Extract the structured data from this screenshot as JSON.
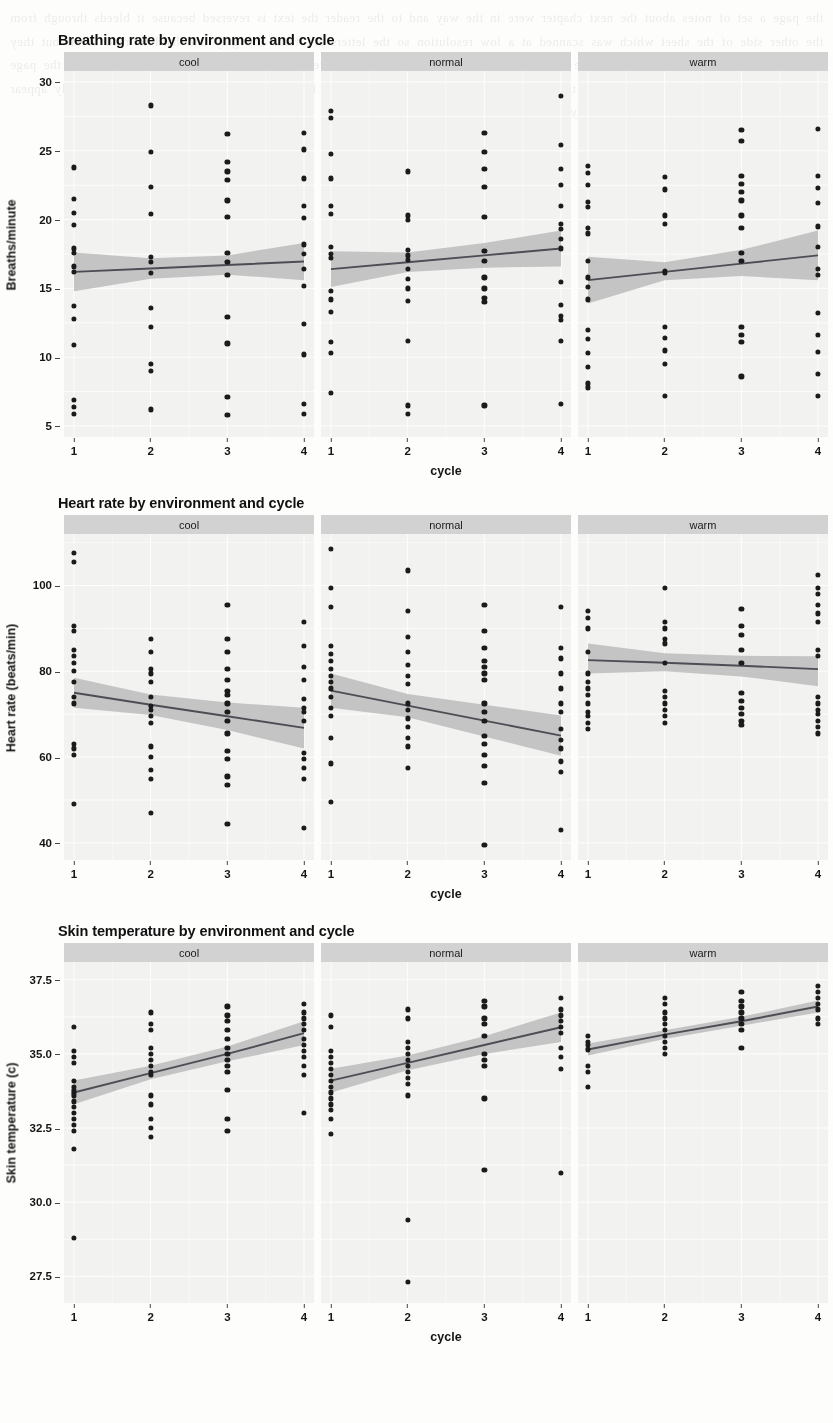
{
  "page": {
    "background_color": "#fdfdfc",
    "bleed_through_text": "the page a set of notes about the next chapter were in the way and to the reader the text is reversed because it bleeds through from the other side of the sheet which was scanned at a low resolution so the letters are faint and grey and hard to read at all but they form a regular block of prose across the whole width of the paper behind the three charts that are printed on this side of the page and continue down past the second and the third panel until the foot of the page is reached where a caption would normally appear for the figure shown above it in the body of the document"
  },
  "common": {
    "facets": [
      "cool",
      "normal",
      "warm"
    ],
    "xlabel": "cycle",
    "xticks": [
      "1",
      "2",
      "3",
      "4"
    ],
    "point_color": "#1b1b1b",
    "line_color": "#4d4d55",
    "ribbon_color": "#b9b9b9",
    "panel_background": "#f2f2f1",
    "strip_background": "#d2d2d2",
    "grid_color": "#ffffff"
  },
  "figures": [
    {
      "title": "Breathing rate by environment and cycle",
      "ylabel": "Breaths/minute"
    },
    {
      "title": "Heart rate by environment and cycle",
      "ylabel": "Heart rate (beats/min)"
    },
    {
      "title": "Skin temperature by environment and cycle",
      "ylabel": "Skin temperature (c)"
    }
  ],
  "chart_data": [
    {
      "type": "scatter",
      "title": "Breathing rate by environment and cycle",
      "xlabel": "cycle",
      "ylabel": "Breaths/minute",
      "x": [
        1,
        2,
        3,
        4
      ],
      "ylim": [
        4.2,
        30.8
      ],
      "yticks": [
        5,
        10,
        15,
        20,
        25,
        30
      ],
      "grid": true,
      "legend": "none",
      "facet_var": "environment",
      "facets": [
        {
          "name": "cool",
          "fit": {
            "type": "linear",
            "y_at_x": [
              16.2,
              16.45,
              16.7,
              16.95
            ]
          },
          "ribbon": {
            "lower": [
              14.8,
              15.7,
              16.0,
              15.6
            ],
            "upper": [
              17.6,
              17.2,
              17.4,
              18.3
            ]
          },
          "points": {
            "1": [
              23.8,
              21.5,
              20.5,
              19.6,
              17.9,
              17.6,
              16.6,
              16.2,
              13.7,
              12.8,
              10.9,
              6.9,
              6.4,
              5.9
            ],
            "2": [
              28.3,
              24.9,
              22.4,
              20.4,
              17.3,
              16.9,
              16.1,
              13.6,
              12.2,
              9.5,
              9.0,
              6.2
            ],
            "3": [
              26.2,
              24.2,
              23.5,
              22.9,
              21.4,
              20.2,
              17.6,
              16.9,
              16.0,
              12.9,
              11.0,
              7.1,
              5.8
            ],
            "4": [
              26.3,
              25.1,
              23.0,
              21.0,
              20.1,
              18.2,
              17.5,
              16.4,
              15.2,
              12.4,
              10.2,
              6.6,
              5.9
            ]
          }
        },
        {
          "name": "normal",
          "fit": {
            "type": "linear",
            "y_at_x": [
              16.4,
              16.9,
              17.4,
              17.9
            ]
          },
          "ribbon": {
            "lower": [
              15.1,
              16.2,
              16.5,
              16.6
            ],
            "upper": [
              17.7,
              17.6,
              18.3,
              19.2
            ]
          },
          "points": {
            "1": [
              27.9,
              27.4,
              24.8,
              23.0,
              21.0,
              20.4,
              18.0,
              17.5,
              17.2,
              14.8,
              14.2,
              13.3,
              11.1,
              10.3,
              7.4
            ],
            "2": [
              23.5,
              20.3,
              20.0,
              17.8,
              17.4,
              17.1,
              16.4,
              15.7,
              15.0,
              14.1,
              11.2,
              6.5,
              5.9
            ],
            "3": [
              26.3,
              24.9,
              23.7,
              22.4,
              20.2,
              17.7,
              17.0,
              15.8,
              15.0,
              14.3,
              14.0,
              6.5
            ],
            "4": [
              29.0,
              25.4,
              23.7,
              22.5,
              21.0,
              19.7,
              19.3,
              18.6,
              17.9,
              15.5,
              13.8,
              13.0,
              12.7,
              11.2,
              6.6
            ]
          }
        },
        {
          "name": "warm",
          "fit": {
            "type": "linear",
            "y_at_x": [
              15.6,
              16.2,
              16.8,
              17.4
            ]
          },
          "ribbon": {
            "lower": [
              13.9,
              15.6,
              15.9,
              15.6
            ],
            "upper": [
              17.3,
              16.9,
              17.8,
              19.2
            ]
          },
          "points": {
            "1": [
              23.9,
              23.4,
              22.5,
              21.3,
              20.9,
              19.4,
              19.0,
              17.0,
              15.8,
              15.1,
              14.2,
              12.0,
              11.3,
              10.3,
              9.3,
              8.1,
              7.8
            ],
            "2": [
              23.1,
              22.2,
              20.3,
              19.7,
              16.3,
              16.1,
              12.2,
              11.4,
              10.5,
              9.5,
              7.2
            ],
            "3": [
              26.5,
              25.7,
              23.2,
              22.6,
              22.0,
              21.4,
              20.3,
              19.4,
              17.6,
              17.0,
              12.2,
              11.6,
              11.1,
              8.6
            ],
            "4": [
              26.6,
              23.2,
              22.3,
              21.2,
              19.5,
              18.0,
              16.4,
              16.0,
              13.2,
              11.6,
              10.4,
              8.8,
              7.2
            ]
          }
        }
      ]
    },
    {
      "type": "scatter",
      "title": "Heart rate by environment and cycle",
      "xlabel": "cycle",
      "ylabel": "Heart rate (beats/min)",
      "x": [
        1,
        2,
        3,
        4
      ],
      "ylim": [
        36,
        112
      ],
      "yticks": [
        40,
        60,
        80,
        100
      ],
      "grid": true,
      "legend": "none",
      "facet_var": "environment",
      "facets": [
        {
          "name": "cool",
          "fit": {
            "type": "linear",
            "y_at_x": [
              75.0,
              72.2,
              69.5,
              66.8
            ]
          },
          "ribbon": {
            "lower": [
              71.5,
              69.8,
              66.3,
              62.0
            ],
            "upper": [
              78.5,
              74.6,
              72.7,
              71.5
            ]
          },
          "points": {
            "1": [
              107.5,
              105.5,
              90.5,
              89.5,
              85.0,
              83.5,
              82.0,
              80.0,
              77.5,
              74.0,
              72.5,
              63.0,
              62.0,
              60.5,
              49.0
            ],
            "2": [
              87.5,
              84.5,
              80.5,
              79.5,
              77.5,
              74.0,
              72.0,
              71.0,
              69.5,
              68.0,
              62.5,
              60.0,
              57.0,
              55.0,
              47.0
            ],
            "3": [
              95.5,
              87.5,
              84.5,
              80.5,
              78.0,
              75.5,
              74.5,
              72.5,
              70.5,
              68.5,
              65.5,
              61.5,
              59.5,
              55.5,
              53.5,
              44.5
            ],
            "4": [
              91.5,
              86.0,
              81.0,
              78.0,
              73.5,
              71.5,
              70.5,
              68.5,
              61.0,
              59.5,
              57.5,
              55.0,
              43.5
            ]
          }
        },
        {
          "name": "normal",
          "fit": {
            "type": "linear",
            "y_at_x": [
              75.5,
              72.0,
              68.5,
              65.0
            ]
          },
          "ribbon": {
            "lower": [
              71.5,
              69.3,
              64.8,
              60.3
            ],
            "upper": [
              79.5,
              74.7,
              72.2,
              69.7
            ]
          },
          "points": {
            "1": [
              108.5,
              99.5,
              95.0,
              86.0,
              84.0,
              82.5,
              80.5,
              79.0,
              77.5,
              76.0,
              74.0,
              71.5,
              69.5,
              64.5,
              58.5,
              49.5
            ],
            "2": [
              103.5,
              94.0,
              88.0,
              84.5,
              81.5,
              79.0,
              77.0,
              72.5,
              71.0,
              69.0,
              67.0,
              64.5,
              62.5,
              57.5
            ],
            "3": [
              95.5,
              89.5,
              85.5,
              82.5,
              81.0,
              79.5,
              78.0,
              72.5,
              70.5,
              68.5,
              65.0,
              63.0,
              60.5,
              58.0,
              54.0,
              39.5
            ],
            "4": [
              95.0,
              85.5,
              83.0,
              79.5,
              76.0,
              72.5,
              70.5,
              66.5,
              64.0,
              62.0,
              59.0,
              56.5,
              43.0
            ]
          }
        },
        {
          "name": "warm",
          "fit": {
            "type": "linear",
            "y_at_x": [
              82.6,
              82.0,
              81.3,
              80.5
            ]
          },
          "ribbon": {
            "lower": [
              79.5,
              80.0,
              78.8,
              76.5
            ],
            "upper": [
              86.5,
              84.2,
              83.6,
              83.5
            ]
          },
          "points": {
            "1": [
              94.0,
              92.5,
              90.0,
              84.5,
              79.5,
              77.5,
              76.0,
              74.5,
              72.5,
              70.5,
              69.5,
              68.0,
              66.5
            ],
            "2": [
              99.5,
              91.5,
              90.0,
              87.5,
              86.5,
              82.0,
              75.5,
              74.0,
              72.5,
              71.0,
              69.5,
              68.0
            ],
            "3": [
              94.5,
              90.5,
              88.5,
              85.0,
              82.0,
              75.0,
              73.0,
              71.5,
              70.0,
              68.5,
              67.5
            ],
            "4": [
              102.5,
              99.5,
              98.0,
              95.5,
              93.5,
              91.5,
              85.0,
              83.5,
              74.0,
              72.5,
              71.0,
              70.0,
              68.5,
              67.0,
              65.5
            ]
          }
        }
      ]
    },
    {
      "type": "scatter",
      "title": "Skin temperature by environment and cycle",
      "xlabel": "cycle",
      "ylabel": "Skin temperature (c)",
      "x": [
        1,
        2,
        3,
        4
      ],
      "ylim": [
        26.6,
        38.1
      ],
      "yticks": [
        27.5,
        30.0,
        32.5,
        35.0,
        37.5
      ],
      "grid": true,
      "legend": "none",
      "facet_var": "environment",
      "facets": [
        {
          "name": "cool",
          "fit": {
            "type": "linear",
            "y_at_x": [
              33.7,
              34.35,
              35.0,
              35.7
            ]
          },
          "ribbon": {
            "lower": [
              33.3,
              34.15,
              34.75,
              35.3
            ],
            "upper": [
              34.1,
              34.6,
              35.25,
              36.1
            ]
          },
          "points": {
            "1": [
              35.9,
              35.1,
              34.9,
              34.7,
              34.1,
              33.9,
              33.8,
              33.7,
              33.6,
              33.4,
              33.2,
              33.0,
              32.8,
              32.6,
              32.4,
              31.8,
              28.8
            ],
            "2": [
              36.4,
              36.0,
              35.8,
              35.2,
              35.0,
              34.8,
              34.6,
              34.4,
              34.3,
              33.6,
              33.3,
              32.8,
              32.5,
              32.2
            ],
            "3": [
              36.6,
              36.3,
              36.1,
              35.8,
              35.5,
              35.2,
              35.0,
              34.8,
              34.6,
              34.4,
              33.8,
              32.8,
              32.4
            ],
            "4": [
              36.7,
              36.4,
              36.2,
              36.0,
              35.8,
              35.5,
              35.3,
              35.1,
              34.9,
              34.6,
              34.3,
              33.0
            ]
          }
        },
        {
          "name": "normal",
          "fit": {
            "type": "linear",
            "y_at_x": [
              34.1,
              34.7,
              35.3,
              35.9
            ]
          },
          "ribbon": {
            "lower": [
              33.7,
              34.45,
              35.0,
              35.4
            ],
            "upper": [
              34.5,
              34.95,
              35.6,
              36.4
            ]
          },
          "points": {
            "1": [
              36.3,
              35.9,
              35.1,
              34.9,
              34.7,
              34.5,
              34.3,
              34.1,
              33.9,
              33.7,
              33.5,
              33.3,
              33.1,
              32.8,
              32.3
            ],
            "2": [
              36.5,
              36.2,
              35.4,
              35.2,
              35.0,
              34.8,
              34.6,
              34.4,
              34.2,
              34.0,
              33.6,
              29.4,
              27.3
            ],
            "3": [
              36.8,
              36.6,
              36.2,
              36.0,
              35.6,
              35.0,
              34.8,
              34.6,
              33.5,
              31.1
            ],
            "4": [
              36.9,
              36.5,
              36.3,
              36.1,
              35.9,
              35.7,
              35.2,
              34.9,
              34.5,
              31.0
            ]
          }
        },
        {
          "name": "warm",
          "fit": {
            "type": "linear",
            "y_at_x": [
              35.15,
              35.65,
              36.1,
              36.6
            ]
          },
          "ribbon": {
            "lower": [
              34.95,
              35.5,
              35.95,
              36.4
            ],
            "upper": [
              35.35,
              35.8,
              36.25,
              36.8
            ]
          },
          "points": {
            "1": [
              35.6,
              35.4,
              35.3,
              35.15,
              34.6,
              34.4,
              33.9
            ],
            "2": [
              36.9,
              36.7,
              36.4,
              36.2,
              36.0,
              35.8,
              35.6,
              35.4,
              35.2,
              35.0
            ],
            "3": [
              37.1,
              36.8,
              36.6,
              36.4,
              36.2,
              36.0,
              35.8,
              35.2
            ],
            "4": [
              37.3,
              37.1,
              36.9,
              36.7,
              36.5,
              36.2,
              36.0
            ]
          }
        }
      ]
    }
  ]
}
